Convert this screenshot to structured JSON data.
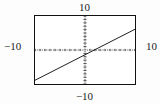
{
  "figure": {
    "kind": "graphing-calculator-viewport",
    "labels": {
      "top": "10",
      "bottom": "−10",
      "left": "−10",
      "right": "10"
    },
    "colors": {
      "frame": "#111111",
      "axis": "#1a1a1a",
      "curve": "#111111",
      "background": "#ffffff",
      "page_background": "#fdfdfd"
    }
  },
  "chart_data": {
    "type": "line",
    "title": "",
    "xlabel": "",
    "ylabel": "",
    "xlim": [
      -10,
      10
    ],
    "ylim": [
      -10,
      10
    ],
    "grid": false,
    "axis_style": "dotted-with-ticks",
    "tick_spacing": 1,
    "legend": null,
    "annotations": [
      {
        "text": "10",
        "position": "top",
        "meaning": "y-axis maximum (Ymax)"
      },
      {
        "text": "-10",
        "position": "bottom",
        "meaning": "y-axis minimum (Ymin)"
      },
      {
        "text": "-10",
        "position": "left",
        "meaning": "x-axis minimum (Xmin)"
      },
      {
        "text": "10",
        "position": "right",
        "meaning": "x-axis maximum (Xmax)"
      }
    ],
    "series": [
      {
        "name": "line",
        "slope": 0.75,
        "intercept": -1.4,
        "x": [
          -10,
          10
        ],
        "y": [
          -8.9,
          6.1
        ]
      }
    ]
  }
}
